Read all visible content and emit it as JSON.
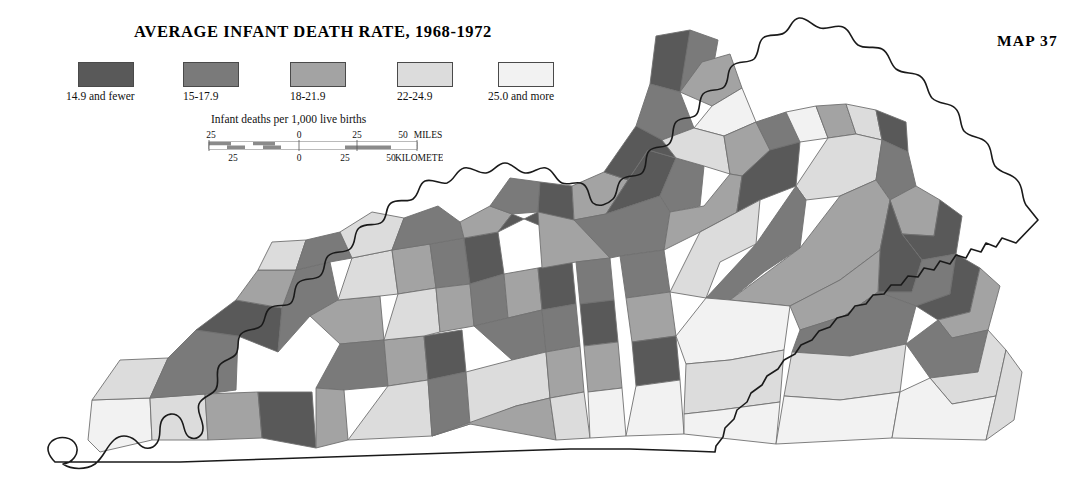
{
  "page": {
    "title": "AVERAGE INFANT DEATH RATE, 1968-1972",
    "map_number": "MAP 37",
    "background_color": "#ffffff",
    "outline_color": "#1a1a1a",
    "county_border_color": "#707070"
  },
  "legend": {
    "items": [
      {
        "label": "14.9 and fewer",
        "color": "#595959"
      },
      {
        "label": "15-17.9",
        "color": "#7a7a7a"
      },
      {
        "label": "18-21.9",
        "color": "#a3a3a3"
      },
      {
        "label": "22-24.9",
        "color": "#dcdcdc"
      },
      {
        "label": "25.0 and more",
        "color": "#f2f2f2"
      }
    ]
  },
  "scale": {
    "caption": "Infant deaths per 1,000 live births",
    "miles_ticks": [
      "25",
      "0",
      "25",
      "50"
    ],
    "miles_unit": "MILES",
    "kilometers_ticks": [
      "25",
      "0",
      "25",
      "50"
    ],
    "kilometers_unit": "KILOMETERS"
  },
  "chart_data": {
    "type": "map",
    "subtype": "choropleth",
    "region": "Kentucky",
    "title": "AVERAGE INFANT DEATH RATE, 1968-1972",
    "value_units": "Infant deaths per 1,000 live births",
    "classes": [
      {
        "label": "14.9 and fewer",
        "color": "#595959",
        "min": null,
        "max": 14.9
      },
      {
        "label": "15-17.9",
        "color": "#7a7a7a",
        "min": 15.0,
        "max": 17.9
      },
      {
        "label": "18-21.9",
        "color": "#a3a3a3",
        "min": 18.0,
        "max": 21.9
      },
      {
        "label": "22-24.9",
        "color": "#dcdcdc",
        "min": 22.0,
        "max": 24.9
      },
      {
        "label": "25.0 and more",
        "color": "#f2f2f2",
        "min": 25.0,
        "max": null
      }
    ],
    "legend_position": "top-left"
  }
}
